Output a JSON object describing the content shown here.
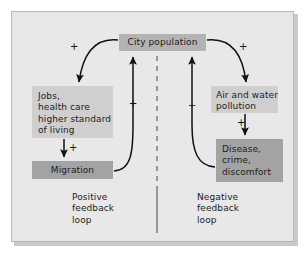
{
  "figure": {
    "background_color": "#e8e8e8",
    "frame_border_color": "#b9b9b9"
  },
  "nodes": {
    "city_population": {
      "label": "City population",
      "fill": "#b3b3b3"
    },
    "jobs": {
      "label": "Jobs,\nhealth care\nhigher standard\nof living",
      "fill": "#cfcfcf"
    },
    "migration": {
      "label": "Migration",
      "fill": "#a3a3a3"
    },
    "pollution": {
      "label": "Air and water\npollution",
      "fill": "#cfcfcf"
    },
    "disease": {
      "label": "Disease,\ncrime,\ndiscomfort",
      "fill": "#a3a3a3"
    }
  },
  "captions": {
    "positive_loop": "Positive\nfeedback\nloop",
    "negative_loop": "Negative\nfeedback\nloop"
  },
  "signs": {
    "city_to_jobs": "+",
    "city_to_pollution": "+",
    "jobs_to_migration": "+",
    "pollution_to_disease": "+",
    "migration_to_city": "+",
    "disease_to_city": "−"
  },
  "edges": [
    {
      "from": "city_population",
      "to": "jobs",
      "sign": "+",
      "style": "curved"
    },
    {
      "from": "jobs",
      "to": "migration",
      "sign": "+",
      "style": "straight"
    },
    {
      "from": "migration",
      "to": "city_population",
      "sign": "+",
      "style": "curved"
    },
    {
      "from": "city_population",
      "to": "pollution",
      "sign": "+",
      "style": "curved"
    },
    {
      "from": "pollution",
      "to": "disease",
      "sign": "+",
      "style": "straight"
    },
    {
      "from": "disease",
      "to": "city_population",
      "sign": "−",
      "style": "curved"
    }
  ],
  "divider": {
    "style": "dashed-then-solid",
    "color": "#555555"
  }
}
